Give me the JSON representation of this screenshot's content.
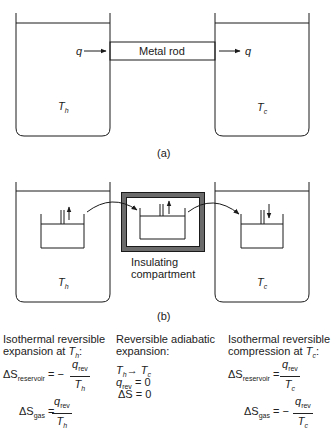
{
  "figure": {
    "panel_a": {
      "label": "(a)",
      "rod_label": "Metal rod",
      "heat_in": "q",
      "heat_out": "q",
      "hot_reservoir": {
        "symbol": "T",
        "subscript": "h"
      },
      "cold_reservoir": {
        "symbol": "T",
        "subscript": "c"
      }
    },
    "panel_b": {
      "label": "(b)",
      "compartment_label_line1": "Insulating",
      "compartment_label_line2": "compartment",
      "hot_reservoir": {
        "symbol": "T",
        "subscript": "h"
      },
      "cold_reservoir": {
        "symbol": "T",
        "subscript": "c"
      }
    },
    "steps": [
      {
        "title_line1": "Isothermal reversible",
        "title_line2": "expansion at ",
        "title_T": "T",
        "title_sub": "h",
        "title_end": ":",
        "eq1_lhs": "ΔS",
        "eq1_lhs_sub": "reservoir",
        "eq1_sign": "= −",
        "eq1_num": "q",
        "eq1_num_sub": "rev",
        "eq1_den": "T",
        "eq1_den_sub": "h",
        "eq2_lhs": "ΔS",
        "eq2_lhs_sub": "gas",
        "eq2_sign": "=",
        "eq2_num": "q",
        "eq2_num_sub": "rev",
        "eq2_den": "T",
        "eq2_den_sub": "h"
      },
      {
        "title_line1": "Reversible adiabatic",
        "title_line2": "expansion:",
        "line1_T1": "T",
        "line1_T1_sub": "h",
        "line1_arrow": "→",
        "line1_T2": "T",
        "line1_T2_sub": "c",
        "line2_q": "q",
        "line2_q_sub": "rev",
        "line2_rest": " = 0",
        "line3": "ΔS = 0"
      },
      {
        "title_line1": "Isothermal reversible",
        "title_line2": "compression at ",
        "title_T": "T",
        "title_sub": "c",
        "title_end": ":",
        "eq1_lhs": "ΔS",
        "eq1_lhs_sub": "reservoir",
        "eq1_sign": "=",
        "eq1_num": "q",
        "eq1_num_sub": "rev",
        "eq1_den": "T",
        "eq1_den_sub": "c",
        "eq2_lhs": "ΔS",
        "eq2_lhs_sub": "gas",
        "eq2_sign": "= −",
        "eq2_num": "q",
        "eq2_num_sub": "rev",
        "eq2_den": "T",
        "eq2_den_sub": "c"
      }
    ],
    "colors": {
      "line": "#1a1a1a",
      "insulation": "#6b6b6b"
    }
  }
}
